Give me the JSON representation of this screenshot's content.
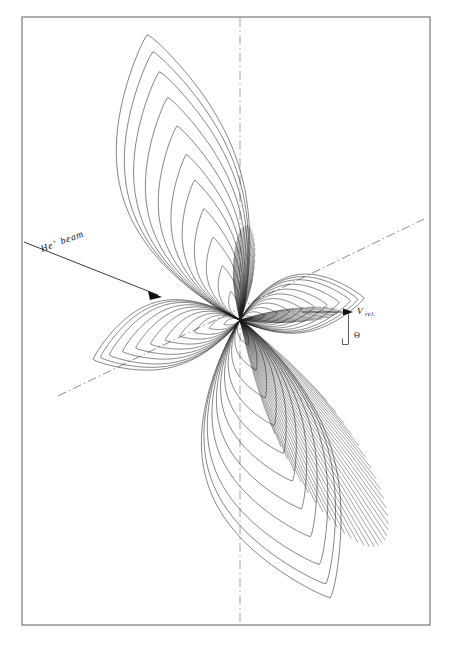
{
  "figure": {
    "kind": "polar-contour-scattering-diagram",
    "background_color": "#ffffff",
    "frame": {
      "stroke_color": "#5c5c5c",
      "x": 22,
      "y": 17,
      "width": 408,
      "height": 608
    },
    "origin": {
      "x": 240,
      "y": 320
    },
    "labels": {
      "beam": "He",
      "beam_superscript": "+",
      "beam_suffix": "beam",
      "vrel": "V",
      "vrel_subscript": "rel.",
      "angle": "Θ"
    },
    "colors": {
      "contour_stroke": "#1b1b1b",
      "axis_stroke": "#6e6e6e",
      "vertical_axis_stroke": "#8a8a8a",
      "annotation_stroke": "#151515",
      "text": "#101010"
    },
    "annotations": {
      "beam_arrow": {
        "from_x": 24,
        "from_y": 242,
        "to_x": 162,
        "to_y": 297,
        "label_x": 42,
        "label_y": 252,
        "label_rotate": -20.5
      },
      "vrel_arrow": {
        "from_x": 302,
        "from_y": 312,
        "to_x": 352,
        "to_y": 312,
        "label_x": 356,
        "label_y": 312
      },
      "drop_line": {
        "x": 349,
        "y_top": 312,
        "y_bottom": 344
      },
      "right_angle": {
        "x": 342,
        "y": 337,
        "size": 6
      },
      "theta_label": {
        "x": 353,
        "y": 340
      }
    },
    "axes": [
      {
        "name": "relative-velocity-axis",
        "style": "dash-dot",
        "x1": 58,
        "y1": 396,
        "x2": 424,
        "y2": 219,
        "angle_deg": -25.8
      },
      {
        "name": "vertical-center-axis",
        "style": "dash-dot",
        "x1": 240,
        "y1": 18,
        "x2": 240,
        "y2": 624
      }
    ]
  },
  "chart_data": {
    "type": "contour",
    "title": "",
    "subtitle": "",
    "xlabel": "",
    "ylabel": "",
    "legend": [],
    "origin": {
      "x": 240,
      "y": 320
    },
    "contour_levels": [
      0.05,
      0.1,
      0.2,
      0.3,
      0.4,
      0.5,
      0.6,
      0.7,
      0.8,
      0.9,
      1.0
    ],
    "n_levels": 11,
    "lobes": [
      {
        "name": "upper-left-lobe",
        "direction_deg": 108,
        "max_radius_px": 300,
        "n_contours": 11,
        "relative_radii": [
          0.1,
          0.19,
          0.29,
          0.39,
          0.49,
          0.58,
          0.68,
          0.78,
          0.87,
          0.94,
          1.0
        ],
        "width_ratio": 0.4,
        "note": "largest lobe, extends to top-left of frame"
      },
      {
        "name": "lower-right-lobe",
        "direction_deg": -72,
        "max_radius_px": 292,
        "n_contours": 11,
        "relative_radii": [
          0.09,
          0.18,
          0.28,
          0.38,
          0.48,
          0.58,
          0.68,
          0.78,
          0.88,
          0.95,
          1.0
        ],
        "width_ratio": 0.44,
        "note": "second largest lobe, extends to bottom of frame"
      },
      {
        "name": "right-lobe",
        "direction_deg": 10,
        "max_radius_px": 126,
        "n_contours": 11,
        "relative_radii": [
          0.1,
          0.2,
          0.3,
          0.4,
          0.5,
          0.6,
          0.7,
          0.8,
          0.89,
          0.95,
          1.0
        ],
        "width_ratio": 0.46,
        "note": "small lobe pointing toward V-rel direction"
      },
      {
        "name": "left-lobe",
        "direction_deg": 195,
        "max_radius_px": 152,
        "n_contours": 11,
        "relative_radii": [
          0.11,
          0.21,
          0.31,
          0.41,
          0.51,
          0.61,
          0.71,
          0.8,
          0.89,
          0.95,
          1.0
        ],
        "width_ratio": 0.44,
        "note": "small-medium lobe pointing left and slightly down"
      }
    ],
    "ray_bundles": [
      {
        "name": "down-right-dense-rays",
        "center_deg": -58,
        "spread_deg": 30,
        "count": 34,
        "length_px": 265
      },
      {
        "name": "up-dense-rays",
        "center_deg": 86,
        "spread_deg": 26,
        "count": 26,
        "length_px": 95
      },
      {
        "name": "right-dense-rays",
        "center_deg": 5,
        "spread_deg": 16,
        "count": 18,
        "length_px": 100
      }
    ]
  }
}
